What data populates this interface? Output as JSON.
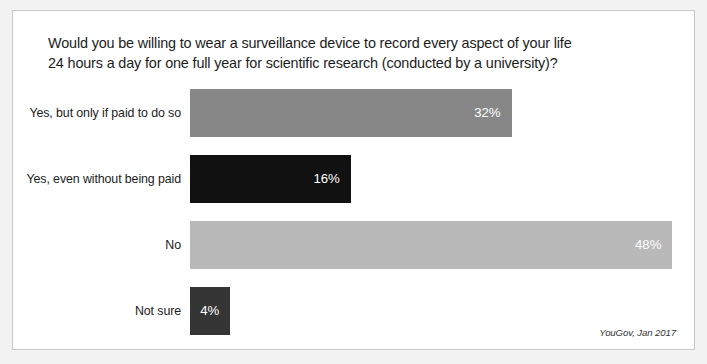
{
  "chart_data": {
    "type": "bar",
    "orientation": "horizontal",
    "title": "Would you be willing to wear a surveillance device to record every aspect of your life\n24 hours a day for one full year for scientific research (conducted by a university)?",
    "xlabel": "",
    "ylabel": "",
    "xlim": [
      0,
      50
    ],
    "grid": false,
    "legend": null,
    "value_suffix": "%",
    "categories": [
      "Yes, but only if paid to do so",
      "Yes, even without being paid",
      "No",
      "Not sure"
    ],
    "values": [
      32,
      16,
      48,
      4
    ],
    "value_labels": [
      "32%",
      "16%",
      "48%",
      "4%"
    ],
    "bar_colors": [
      "#878787",
      "#111111",
      "#b9b9b9",
      "#353535"
    ],
    "source": "YouGov, Jan 2017"
  },
  "frame": {
    "background": "#ffffff",
    "border_color": "#c9c9c9"
  },
  "page": {
    "background": "#f2f2f2"
  }
}
